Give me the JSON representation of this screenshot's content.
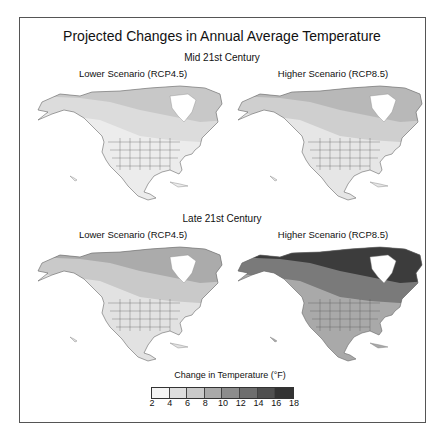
{
  "title": "Projected Changes in  Annual Average Temperature",
  "sections": [
    {
      "label": "Mid 21st Century",
      "panels": [
        {
          "label": "Lower Scenario (RCP4.5)",
          "bands": [
            "#ececec",
            "#dcdcdc",
            "#c8c8c8"
          ]
        },
        {
          "label": "Higher Scenario (RCP8.5)",
          "bands": [
            "#e6e6e6",
            "#cfcfcf",
            "#b8b8b8"
          ]
        }
      ]
    },
    {
      "label": "Late 21st Century",
      "panels": [
        {
          "label": "Lower Scenario (RCP4.5)",
          "bands": [
            "#e2e2e2",
            "#c9c9c9",
            "#ababab"
          ]
        },
        {
          "label": "Higher Scenario (RCP8.5)",
          "bands": [
            "#a9a9a9",
            "#7a7a7a",
            "#3c3c3c"
          ]
        }
      ]
    }
  ],
  "legend": {
    "title": "Change in Temperature (°F)",
    "colors": [
      "#f4f4f4",
      "#dedede",
      "#c9c9c9",
      "#a9a9a9",
      "#8c8c8c",
      "#6e6e6e",
      "#4f4f4f",
      "#333333"
    ],
    "ticks": [
      "2",
      "4",
      "6",
      "8",
      "10",
      "12",
      "14",
      "16",
      "18"
    ]
  },
  "chart_data": {
    "type": "heatmap",
    "title": "Projected Changes in  Annual Average Temperature",
    "panels": [
      {
        "period": "Mid 21st Century",
        "scenario": "Lower Scenario (RCP4.5)",
        "range_F": [
          2,
          6
        ]
      },
      {
        "period": "Mid 21st Century",
        "scenario": "Higher Scenario (RCP8.5)",
        "range_F": [
          2,
          8
        ]
      },
      {
        "period": "Late 21st Century",
        "scenario": "Lower Scenario (RCP4.5)",
        "range_F": [
          2,
          10
        ]
      },
      {
        "period": "Late 21st Century",
        "scenario": "Higher Scenario (RCP8.5)",
        "range_F": [
          6,
          18
        ]
      }
    ],
    "legend": {
      "title": "Change in Temperature (°F)",
      "bins": [
        [
          2,
          4
        ],
        [
          4,
          6
        ],
        [
          6,
          8
        ],
        [
          8,
          10
        ],
        [
          10,
          12
        ],
        [
          12,
          14
        ],
        [
          14,
          16
        ],
        [
          16,
          18
        ]
      ]
    }
  }
}
